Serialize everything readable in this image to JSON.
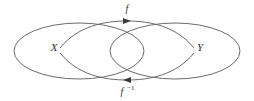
{
  "diagram": {
    "type": "set-mapping-diagram",
    "background_color": "#ffffff",
    "stroke_color": "#6b6b6b",
    "arrow_color": "#3a3a3a",
    "label_color": "#2e2e2e",
    "sets": [
      {
        "id": "set-x",
        "label": "X",
        "label_x": 54,
        "label_y": 51,
        "ellipse": {
          "cx": 79,
          "cy": 51,
          "rx": 65,
          "ry": 28
        }
      },
      {
        "id": "set-y",
        "label": "Y",
        "label_x": 200,
        "label_y": 51,
        "ellipse": {
          "cx": 175,
          "cy": 51,
          "rx": 65,
          "ry": 28
        }
      }
    ],
    "maps": [
      {
        "id": "map-forward",
        "label": "f",
        "label_x": 127,
        "label_y": 12,
        "direction": "right",
        "arrow_x": 127,
        "arrow_y": 21,
        "path": "M 60,48 C 78,26 104,21 127,21 C 150,21 176,26 194,48"
      },
      {
        "id": "map-inverse",
        "label": "f",
        "superscript": "−1",
        "label_x": 127,
        "label_y": 95,
        "direction": "left",
        "arrow_x": 127,
        "arrow_y": 80,
        "path": "M 194,53 C 176,75 150,80 127,80 C 104,80 78,75 60,53"
      }
    ]
  }
}
